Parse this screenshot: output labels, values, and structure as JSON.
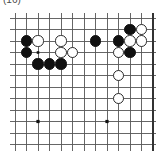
{
  "caption": {
    "label": "(16)"
  },
  "board": {
    "kind": "go-board-diagram",
    "description": "Go (baduk) board position diagram, partial board crop",
    "cols": 13,
    "rows": 12,
    "cell_px": 11.5,
    "origin_px": [
      5,
      5
    ],
    "stone_radius_px": 5.6,
    "line_color": "#555555",
    "edge_color": "#333333",
    "black_color": "#101010",
    "white_color": "#ffffff",
    "white_outline_color": "#2a2a2a",
    "background_color": "#ffffff",
    "right_edge_is_board_border": true,
    "star_points": [
      {
        "col": 2,
        "row": 9
      },
      {
        "col": 8,
        "row": 9
      }
    ],
    "stones": [
      {
        "color": "black",
        "col": 1,
        "row": 2
      },
      {
        "color": "white",
        "col": 2,
        "row": 2
      },
      {
        "color": "white",
        "col": 4,
        "row": 2
      },
      {
        "color": "black",
        "col": 7,
        "row": 2
      },
      {
        "color": "black",
        "col": 9,
        "row": 2
      },
      {
        "color": "white",
        "col": 10,
        "row": 2
      },
      {
        "color": "white",
        "col": 11,
        "row": 2
      },
      {
        "color": "black",
        "col": 10,
        "row": 1
      },
      {
        "color": "white",
        "col": 11,
        "row": 1
      },
      {
        "color": "black",
        "col": 1,
        "row": 3
      },
      {
        "color": "white",
        "col": 4,
        "row": 3
      },
      {
        "color": "white",
        "col": 5,
        "row": 3
      },
      {
        "color": "white",
        "col": 9,
        "row": 3
      },
      {
        "color": "black",
        "col": 10,
        "row": 3
      },
      {
        "color": "black",
        "col": 2,
        "row": 4
      },
      {
        "color": "black",
        "col": 3,
        "row": 4
      },
      {
        "color": "black",
        "col": 4,
        "row": 4
      },
      {
        "color": "white",
        "col": 9,
        "row": 5
      },
      {
        "color": "white",
        "col": 9,
        "row": 7
      }
    ],
    "marks": [
      {
        "type": "small-dot",
        "col": 2,
        "row": 3
      }
    ]
  }
}
